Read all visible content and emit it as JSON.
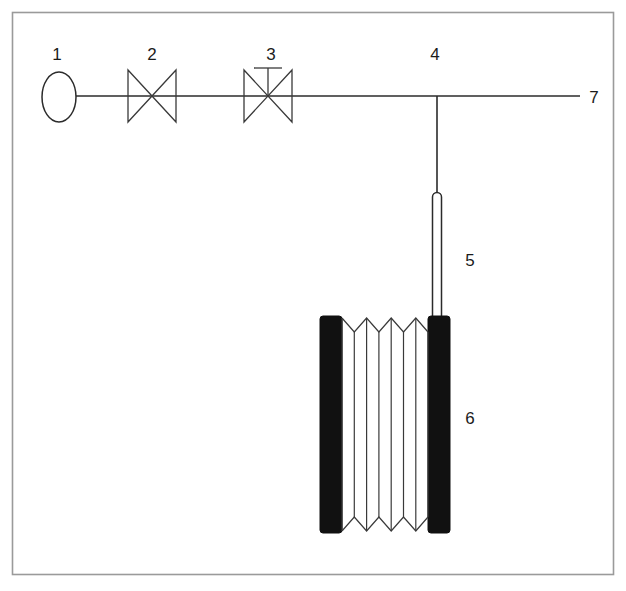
{
  "figure": {
    "width": 626,
    "height": 591,
    "background_color": "#ffffff",
    "frame_color": "#9a9a9a",
    "line_color": "#2b2b2b",
    "block_fill_color": "#111111"
  },
  "labels": [
    {
      "id": "1",
      "text": "1",
      "x": 57,
      "y": 60,
      "refers_to": "gas-source-vessel"
    },
    {
      "id": "2",
      "text": "2",
      "x": 152,
      "y": 60,
      "refers_to": "gate-valve"
    },
    {
      "id": "3",
      "text": "3",
      "x": 271,
      "y": 60,
      "refers_to": "stem-valve"
    },
    {
      "id": "4",
      "text": "4",
      "x": 435,
      "y": 60,
      "refers_to": "tee-junction"
    },
    {
      "id": "5",
      "text": "5",
      "x": 470,
      "y": 266,
      "refers_to": "vertical-probe-tube"
    },
    {
      "id": "6",
      "text": "6",
      "x": 470,
      "y": 424,
      "refers_to": "coil-reactor-assembly"
    },
    {
      "id": "7",
      "text": "7",
      "x": 594,
      "y": 103,
      "refers_to": "outlet-line"
    }
  ],
  "components": {
    "frame": {
      "x": 12,
      "y": 12,
      "width": 602,
      "height": 563
    },
    "gas_source_vessel": {
      "cx": 59,
      "cy": 97,
      "rx": 17,
      "ry": 25,
      "shape": "ellipse"
    },
    "pipe_main": {
      "y": 96,
      "x_start": 76,
      "x_end": 580
    },
    "gate_valve": {
      "cx": 152,
      "cy": 96,
      "half_width": 24,
      "half_height": 26,
      "has_stem": false
    },
    "stem_valve": {
      "cx": 268,
      "cy": 96,
      "half_width": 24,
      "half_height": 26,
      "has_stem": true,
      "stem_top_y": 68,
      "handle_half_width": 14
    },
    "tee_junction": {
      "x": 437,
      "y": 96
    },
    "probe_tube": {
      "cx": 437,
      "top_y": 192,
      "bottom_y": 320,
      "width": 9,
      "shape": "capsule"
    },
    "coil_assembly": {
      "left_block": {
        "x": 320,
        "y": 316,
        "width": 22,
        "height": 217
      },
      "right_block": {
        "x": 428,
        "y": 316,
        "width": 22,
        "height": 217
      },
      "coil": {
        "x_start": 342,
        "x_end": 428,
        "y_top": 318,
        "y_bottom": 531,
        "zigzag_peaks": 7
      }
    }
  }
}
